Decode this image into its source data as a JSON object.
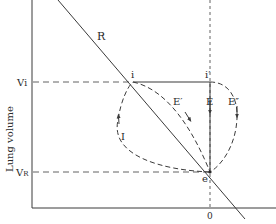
{
  "diagram": {
    "type": "pressure-volume loop",
    "y_axis_label": "Lung volume",
    "x_axis_label": "Pressure, cm H2O",
    "x_axis_tick": "0",
    "volume_levels": [
      {
        "label": "Vi",
        "name": "inspiratory volume"
      },
      {
        "label": "VR",
        "name": "relaxation volume"
      }
    ],
    "line_label": "R",
    "points": [
      {
        "label": "i"
      },
      {
        "label": "i′"
      },
      {
        "label": "e"
      }
    ],
    "curves": [
      {
        "label": "I"
      },
      {
        "label": "E′"
      },
      {
        "label": "E"
      },
      {
        "label": "E″"
      }
    ]
  },
  "colors": {
    "line": "#3a3a3a",
    "background": "#ffffff"
  }
}
